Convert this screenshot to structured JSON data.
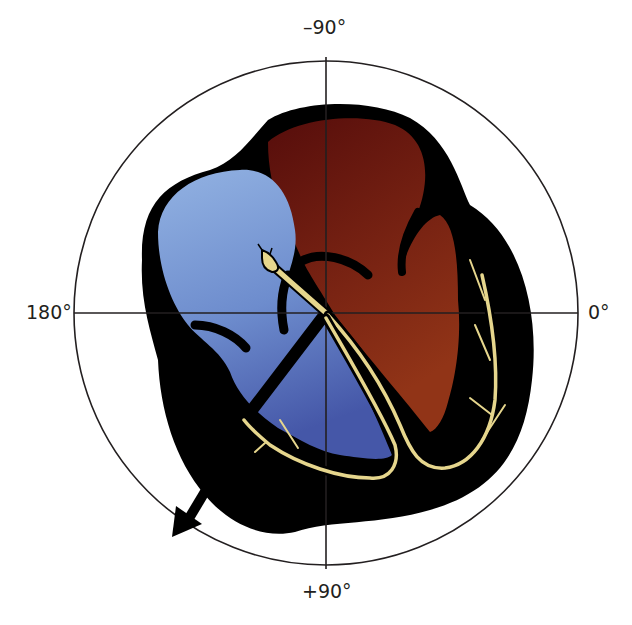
{
  "diagram": {
    "axis_labels": {
      "top": "–90°",
      "bottom": "+90°",
      "left": "180°",
      "right": "0°"
    },
    "reference_circle": {
      "center": [
        326,
        313
      ],
      "radius": 253
    },
    "electrical_axis_arrow": {
      "direction": "lower-left",
      "approx_angle_deg": 130
    },
    "regions": [
      {
        "name": "right-heart-chambers",
        "color": "#7f9fd4"
      },
      {
        "name": "left-heart-chambers",
        "color": "#6b1a12"
      },
      {
        "name": "myocardium-outline",
        "color": "#000000"
      },
      {
        "name": "conduction-system",
        "color": "#e2d38a"
      }
    ],
    "colors": {
      "background": "#ffffff",
      "circle_line": "#231f20",
      "blue_top": "#8fafe0",
      "blue_bottom": "#4a5fae",
      "red_top": "#5a0f0c",
      "red_bottom": "#8a2e16",
      "conduction": "#e6d68d"
    }
  }
}
